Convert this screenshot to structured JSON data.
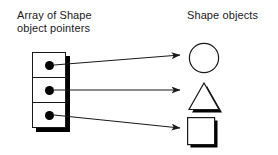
{
  "diagram": {
    "background_color": "#ffffff",
    "ink_color": "#1a1a1a",
    "shadow_color": "#000000"
  },
  "labels": {
    "array_label": "Array of Shape\nobject pointers",
    "shapes_label": "Shape objects"
  },
  "pointer_array": {
    "cell_count": 3,
    "cells": [
      {
        "index": 0,
        "marker": "filled-dot",
        "points_to": "circle"
      },
      {
        "index": 1,
        "marker": "filled-dot",
        "points_to": "triangle"
      },
      {
        "index": 2,
        "marker": "filled-dot",
        "points_to": "square"
      }
    ]
  },
  "arrows": [
    {
      "from_cell": 0,
      "to_shape": "circle",
      "direction": "up-right",
      "x1": 54,
      "y1": 65,
      "x2": 180,
      "y2": 55
    },
    {
      "from_cell": 1,
      "to_shape": "triangle",
      "direction": "horizontal",
      "x1": 54,
      "y1": 90,
      "x2": 180,
      "y2": 90
    },
    {
      "from_cell": 2,
      "to_shape": "square",
      "direction": "down-right",
      "x1": 54,
      "y1": 115,
      "x2": 180,
      "y2": 128
    }
  ],
  "shapes": [
    {
      "name": "circle",
      "label": "circle-shape",
      "has_shadow": true
    },
    {
      "name": "triangle",
      "label": "triangle-shape",
      "has_shadow": true
    },
    {
      "name": "square",
      "label": "square-shape",
      "has_shadow": true
    }
  ]
}
